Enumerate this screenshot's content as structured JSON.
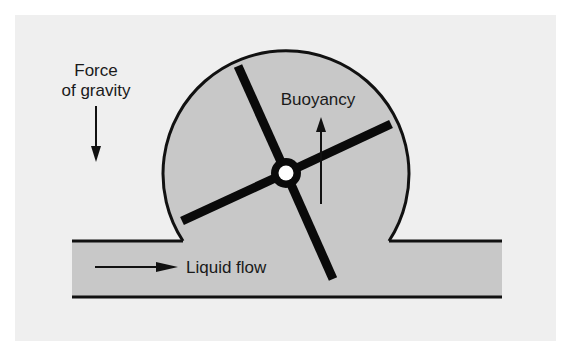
{
  "diagram": {
    "labels": {
      "gravity_line1": "Force",
      "gravity_line2": "of gravity",
      "buoyancy": "Buoyancy",
      "liquid_flow": "Liquid flow"
    },
    "colors": {
      "page": "#ffffff",
      "panel": "#efefef",
      "fluid": "#c8c8c8",
      "stroke": "#111111",
      "hub_center": "#ffffff"
    }
  }
}
